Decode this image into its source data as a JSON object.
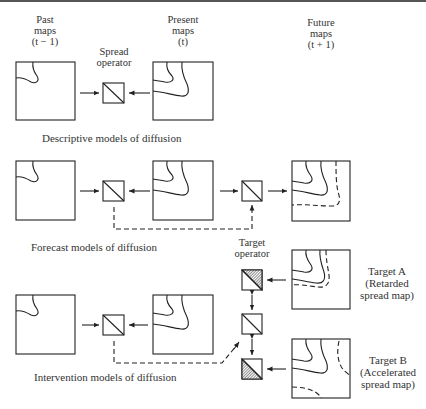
{
  "header": {
    "past_maps": "Past\nmaps\n(t − 1)",
    "present_maps": "Present\nmaps\n(t)",
    "future_maps": "Future\nmaps\n(t + 1)",
    "spread_operator": "Spread\noperator",
    "target_operator": "Target\noperator"
  },
  "rows": [
    {
      "caption": "Descriptive models of diffusion"
    },
    {
      "caption": "Forecast models of diffusion"
    },
    {
      "caption": "Intervention models of diffusion"
    }
  ],
  "targets": {
    "a": "Target A\n(Retarded\nspread map)",
    "b": "Target B\n(Accelerated\nspread map)"
  },
  "colors": {
    "line": "#222222",
    "background": "#ffffff",
    "hatch": "#555555"
  }
}
